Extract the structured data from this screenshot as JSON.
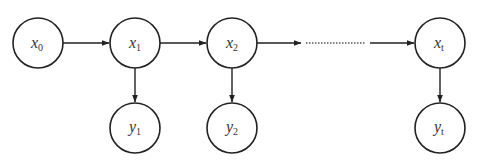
{
  "diagram": {
    "type": "hidden-markov-model",
    "stroke_color": "#222222",
    "background": "#ffffff",
    "nodes": [
      {
        "id": "x0",
        "var": "x",
        "sub": "0",
        "cx": 38,
        "cy": 43,
        "r": 25
      },
      {
        "id": "x1",
        "var": "x",
        "sub": "1",
        "cx": 135,
        "cy": 43,
        "r": 25
      },
      {
        "id": "x2",
        "var": "x",
        "sub": "2",
        "cx": 232,
        "cy": 43,
        "r": 25
      },
      {
        "id": "xt",
        "var": "x",
        "sub": "t",
        "cx": 440,
        "cy": 43,
        "r": 25
      },
      {
        "id": "y1",
        "var": "y",
        "sub": "1",
        "cx": 135,
        "cy": 128,
        "r": 25
      },
      {
        "id": "y2",
        "var": "y",
        "sub": "2",
        "cx": 232,
        "cy": 128,
        "r": 25
      },
      {
        "id": "yt",
        "var": "y",
        "sub": "t",
        "cx": 440,
        "cy": 128,
        "r": 25
      }
    ],
    "edges": [
      {
        "from": "x0",
        "to": "x1",
        "style": "solid"
      },
      {
        "from": "x1",
        "to": "x2",
        "style": "solid"
      },
      {
        "from": "x2",
        "to": "ellipsis",
        "style": "solid"
      },
      {
        "from": "ellipsis",
        "to": "ellipsis",
        "style": "dotted"
      },
      {
        "from": "ellipsis",
        "to": "xt",
        "style": "solid"
      },
      {
        "from": "x1",
        "to": "y1",
        "style": "solid"
      },
      {
        "from": "x2",
        "to": "y2",
        "style": "solid"
      },
      {
        "from": "xt",
        "to": "yt",
        "style": "solid"
      }
    ]
  },
  "labels": {
    "x0": {
      "var": "x",
      "sub": "0"
    },
    "x1": {
      "var": "x",
      "sub": "1"
    },
    "x2": {
      "var": "x",
      "sub": "2"
    },
    "xt": {
      "var": "x",
      "sub": "t"
    },
    "y1": {
      "var": "y",
      "sub": "1"
    },
    "y2": {
      "var": "y",
      "sub": "2"
    },
    "yt": {
      "var": "y",
      "sub": "t"
    }
  }
}
